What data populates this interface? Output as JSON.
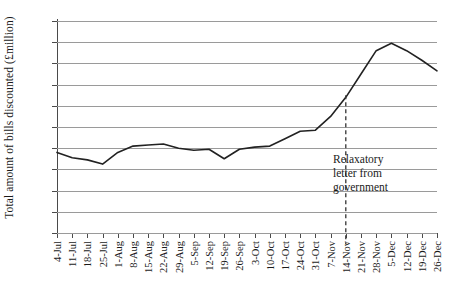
{
  "chart_data": {
    "type": "line",
    "title": "",
    "xlabel": "",
    "ylabel": "Total amount of bills discounted (£million)",
    "ylim": [
      0,
      20
    ],
    "ytick_step": 2,
    "yticks": [
      0,
      2,
      4,
      6,
      8,
      10,
      12,
      14,
      16,
      18,
      20
    ],
    "grid": "horizontal",
    "legend": "none",
    "line_color": "#222222",
    "grid_color": "#9a9a9a",
    "axis_color": "#4a4a4a",
    "categories": [
      "4-Jul",
      "11-Jul",
      "18-Jul",
      "25-Jul",
      "1-Aug",
      "8-Aug",
      "15-Aug",
      "22-Aug",
      "29-Aug",
      "5-Sep",
      "12-Sep",
      "19-Sep",
      "26-Sep",
      "3-Oct",
      "10-Oct",
      "17-Oct",
      "24-Oct",
      "31-Oct",
      "7-Nov",
      "14-Nov",
      "21-Nov",
      "28-Nov",
      "5-Dec",
      "12-Dec",
      "19-Dec",
      "26-Dec"
    ],
    "values": [
      7.6,
      7.1,
      6.9,
      6.5,
      7.6,
      8.2,
      8.3,
      8.4,
      8.0,
      7.8,
      7.9,
      7.0,
      7.9,
      8.1,
      8.2,
      8.9,
      9.6,
      9.7,
      11.0,
      12.8,
      15.0,
      17.2,
      17.9,
      17.2,
      16.3,
      15.3
    ],
    "annotations": [
      {
        "type": "vertical-dashed-line",
        "at_category": "14-Nov",
        "label_lines": [
          "Relaxatory",
          "letter from",
          "government"
        ]
      }
    ]
  }
}
